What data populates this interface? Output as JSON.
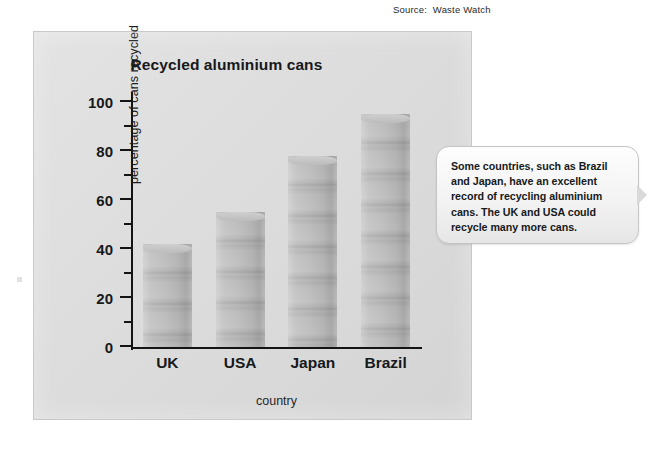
{
  "source_credit": "Source:  Waste Watch",
  "callout": {
    "text": "Some countries, such as Brazil and Japan, have an excellent record of recycling aluminium cans. The UK and USA could recycle many more cans."
  },
  "margin_mark": "",
  "chart_data": {
    "type": "bar",
    "title": "Recycled aluminium cans",
    "xlabel": "country",
    "ylabel": "percentage of cans recycled",
    "categories": [
      "UK",
      "USA",
      "Japan",
      "Brazil"
    ],
    "values": [
      42,
      55,
      78,
      95
    ],
    "ylim": [
      0,
      100
    ],
    "ytick_labels": [
      "0",
      "20",
      "40",
      "60",
      "80",
      "100"
    ],
    "ytick_values": [
      0,
      20,
      40,
      60,
      80,
      100
    ],
    "yminor_ticks": [
      10,
      30,
      50,
      70,
      90
    ],
    "grid": false,
    "legend": "none",
    "bar_style": "stacked-cans",
    "bar_color": "#bcbcbc"
  }
}
